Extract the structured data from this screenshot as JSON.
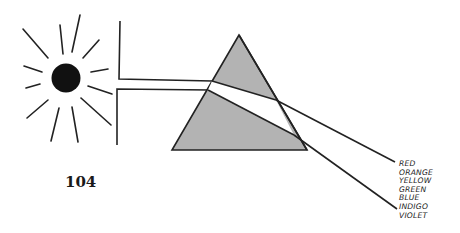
{
  "page_number": "104",
  "spectrum_labels": [
    "RED",
    "ORANGE",
    "YELLOW",
    "GREEN",
    "BLUE",
    "INDIGO",
    "VIOLET"
  ],
  "colors": {
    "prism_fill": "#b3b3b3",
    "line": "#222222",
    "sun": "#111111"
  }
}
